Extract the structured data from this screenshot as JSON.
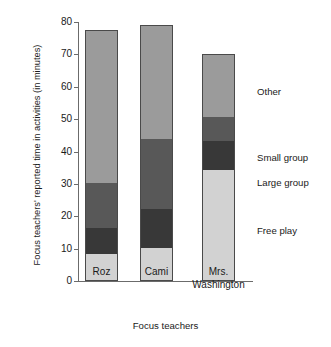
{
  "chart_data": {
    "type": "bar",
    "subtype": "stacked-bar",
    "title": "",
    "xlabel": "Focus teachers",
    "ylabel": "Focus teachers' reported time in activities (in minutes)",
    "categories": [
      "Roz",
      "Cami",
      "Mrs. Washington"
    ],
    "category_lines": [
      [
        "Roz"
      ],
      [
        "Cami"
      ],
      [
        "Mrs.",
        "Washington"
      ]
    ],
    "ylim": [
      0,
      80
    ],
    "yticks": [
      0,
      10,
      20,
      30,
      40,
      50,
      60,
      70,
      80
    ],
    "ytick_labels": [
      "0",
      "10",
      "20",
      "30",
      "40",
      "50",
      "60",
      "70",
      "80"
    ],
    "grid": false,
    "legend_position": "right-inline",
    "stack_order_bottom_to_top": [
      "Free play",
      "Large group",
      "Small group",
      "Other"
    ],
    "series": [
      {
        "name": "Free play",
        "color": "#d2d2d2",
        "values": [
          8,
          10,
          34
        ]
      },
      {
        "name": "Large group",
        "color": "#383838",
        "values": [
          8,
          12,
          9
        ]
      },
      {
        "name": "Small group",
        "color": "#585858",
        "values": [
          14,
          21.5,
          7.5
        ]
      },
      {
        "name": "Other",
        "color": "#9b9b9b",
        "values": [
          47.5,
          35.5,
          19.5
        ]
      }
    ],
    "totals": [
      77.5,
      79,
      70
    ],
    "legend_entries": [
      {
        "label": "Other",
        "color": "#9b9b9b",
        "y": 87
      },
      {
        "label": "Small group",
        "color": "#585858",
        "y": 153
      },
      {
        "label": "Large group",
        "color": "#383838",
        "y": 178
      },
      {
        "label": "Free play",
        "color": "#d2d2d2",
        "y": 226
      }
    ]
  },
  "axis_colors": {
    "axis_line": "#6b6b6b",
    "bar_border": "#4a4a4a",
    "text": "#1a1a1a",
    "background": "#ffffff"
  }
}
